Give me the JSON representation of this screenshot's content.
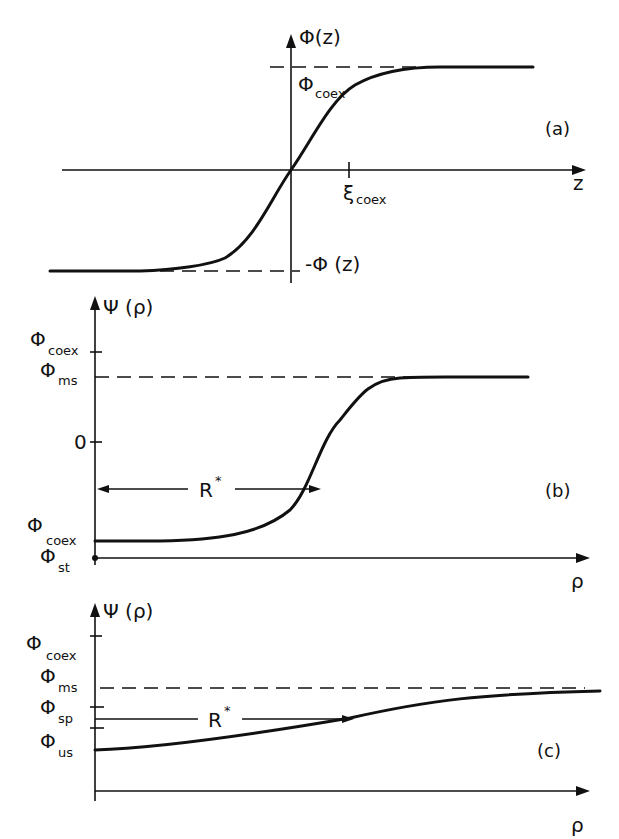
{
  "figure": {
    "panels": [
      {
        "id": "a",
        "tag": "(a)",
        "y_axis_label": "Φ(z)",
        "x_axis_label": "z",
        "upper_level_label": "Φ",
        "upper_level_sub": "coex",
        "lower_level_label": "-Φ (z)",
        "x_tick_label": "ξ",
        "x_tick_sub": "coex",
        "description": "Symmetric tanh-like interface profile passing through origin, saturating at ±Φ_coex"
      },
      {
        "id": "b",
        "tag": "(b)",
        "y_axis_label": "Ψ (ρ)",
        "x_axis_label": "ρ",
        "y_ticks": [
          {
            "main": "Φ",
            "sub": "coex"
          },
          {
            "main": "Φ",
            "sub": "ms"
          },
          {
            "main": "0",
            "sub": ""
          },
          {
            "main": "Φ",
            "sub": "coex"
          },
          {
            "main": "Φ",
            "sub": "st"
          }
        ],
        "radius_label": "R",
        "radius_sup": "*",
        "description": "Droplet profile rising from -Φ_coex at ρ=0 to Φ_ms plateau; R* marks the crossing of 0"
      },
      {
        "id": "c",
        "tag": "(c)",
        "y_axis_label": "Ψ (ρ)",
        "x_axis_label": "ρ",
        "y_ticks": [
          {
            "main": "Φ",
            "sub": "coex"
          },
          {
            "main": "Φ",
            "sub": "ms"
          },
          {
            "main": "Φ",
            "sub": "sp"
          },
          {
            "main": "Φ",
            "sub": "us"
          }
        ],
        "radius_label": "R",
        "radius_sup": "*",
        "description": "Shallow profile starting at Φ_us, slowly approaching Φ_ms; R* arrow at level between Φ_sp and Φ_us"
      }
    ]
  },
  "colors": {
    "ink": "#111111",
    "background": "#ffffff"
  }
}
